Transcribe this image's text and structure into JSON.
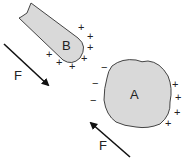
{
  "diagram": {
    "type": "electrostatic-induction",
    "colors": {
      "body_fill": "#d9d9d9",
      "outline": "#444444",
      "text": "#222222",
      "arrow": "#111111"
    },
    "object_b": {
      "label": "B",
      "shape": "rod",
      "charges": [
        {
          "sign": "+",
          "x": 80,
          "y": 28
        },
        {
          "sign": "+",
          "x": 89,
          "y": 37
        },
        {
          "sign": "+",
          "x": 89,
          "y": 48
        },
        {
          "sign": "+",
          "x": 83,
          "y": 59
        },
        {
          "sign": "+",
          "x": 71,
          "y": 67
        },
        {
          "sign": "+",
          "x": 58,
          "y": 63
        },
        {
          "sign": "+",
          "x": 48,
          "y": 55
        }
      ]
    },
    "object_a": {
      "label": "A",
      "shape": "irregular-blob",
      "charges": [
        {
          "sign": "−",
          "x": 104,
          "y": 68
        },
        {
          "sign": "−",
          "x": 95,
          "y": 84
        },
        {
          "sign": "−",
          "x": 93,
          "y": 101
        },
        {
          "sign": "+",
          "x": 175,
          "y": 85
        },
        {
          "sign": "+",
          "x": 178,
          "y": 98
        },
        {
          "sign": "+",
          "x": 177,
          "y": 113
        },
        {
          "sign": "+",
          "x": 168,
          "y": 124
        }
      ]
    },
    "force_b": {
      "label": "F",
      "direction": "down-right"
    },
    "force_a": {
      "label": "F",
      "direction": "up-left"
    }
  }
}
